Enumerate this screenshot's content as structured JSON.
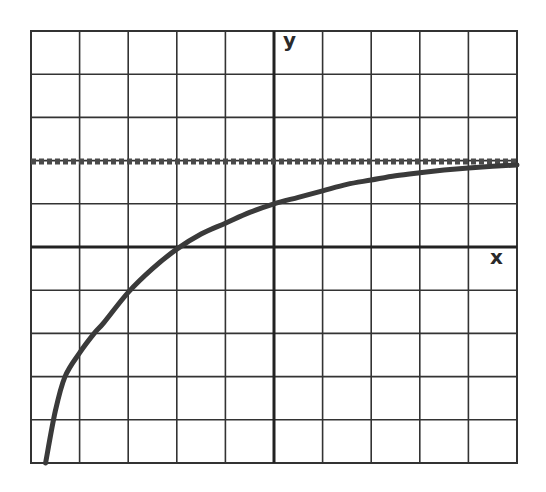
{
  "chart_data": {
    "type": "line",
    "title": "",
    "xlabel": "x",
    "ylabel": "y",
    "xlim": [
      -5,
      5
    ],
    "ylim": [
      -5,
      5
    ],
    "grid": true,
    "grid_step": 1,
    "legend": null,
    "colors": {
      "curve": "#3a3a3a",
      "asymptote": "#4a4a4a",
      "grid": "#333333",
      "axes": "#222222"
    },
    "series": [
      {
        "name": "curve",
        "style": "solid",
        "x": [
          -4.7,
          -4.5,
          -4.3,
          -4.0,
          -3.7,
          -3.5,
          -3.0,
          -2.5,
          -2.0,
          -1.5,
          -1.0,
          -0.5,
          0.0,
          0.5,
          1.0,
          1.5,
          2.0,
          2.5,
          3.0,
          3.5,
          4.0,
          4.5,
          5.0
        ],
        "y": [
          -5.0,
          -3.8,
          -3.0,
          -2.45,
          -2.0,
          -1.75,
          -1.05,
          -0.5,
          -0.05,
          0.3,
          0.55,
          0.8,
          1.0,
          1.15,
          1.3,
          1.45,
          1.55,
          1.65,
          1.72,
          1.78,
          1.83,
          1.87,
          1.9
        ]
      },
      {
        "name": "horizontal asymptote",
        "style": "dashed",
        "x": [
          -5,
          5
        ],
        "y": [
          2,
          2
        ]
      }
    ],
    "annotations": [
      "asymptote y = 2 (dashed)",
      "x-intercept at x = -2",
      "y-intercept at y = 1"
    ]
  },
  "labels": {
    "x_axis": "x",
    "y_axis": "y"
  }
}
